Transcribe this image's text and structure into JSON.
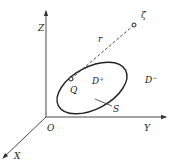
{
  "diagram": {
    "type": "3d-coordinate-region-sketch",
    "colors": {
      "stroke": "#222222",
      "axis": "#333333",
      "background": "#ffffff"
    },
    "axes": {
      "origin_label": "O",
      "x_label": "X",
      "y_label": "Y",
      "z_label": "Z"
    },
    "boundary": {
      "label": "S",
      "shape": "ellipse"
    },
    "regions": {
      "interior": {
        "base": "D",
        "sup": "+"
      },
      "exterior": {
        "base": "D",
        "sup": "−"
      }
    },
    "points": [
      {
        "id": "Q",
        "label": "Q",
        "location": "inside"
      },
      {
        "id": "zeta",
        "label": "ζ",
        "location": "outside"
      }
    ],
    "segment": {
      "label": "r",
      "from": "Q",
      "to": "ζ",
      "style": "dashed"
    }
  }
}
